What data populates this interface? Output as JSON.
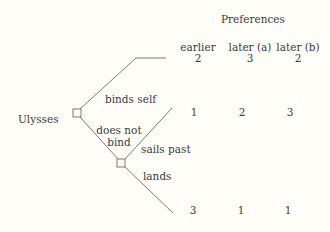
{
  "header": {
    "title": "Preferences",
    "columns": [
      "earlier",
      "later (a)",
      "later (b)"
    ]
  },
  "tree": {
    "root_player": "Ulysses",
    "root_branches": [
      "binds self",
      "does not bind"
    ],
    "sub_branches": [
      "sails past",
      "lands"
    ]
  },
  "outcomes": [
    {
      "branch": "binds self",
      "values": [
        "2",
        "3",
        "2"
      ]
    },
    {
      "branch": "does not bind / sails past",
      "values": [
        "1",
        "2",
        "3"
      ]
    },
    {
      "branch": "does not bind / lands",
      "values": [
        "3",
        "1",
        "1"
      ]
    }
  ],
  "colors": {
    "line": "#6a6a6a",
    "text": "#3a3a3a",
    "background": "#fffef8"
  }
}
